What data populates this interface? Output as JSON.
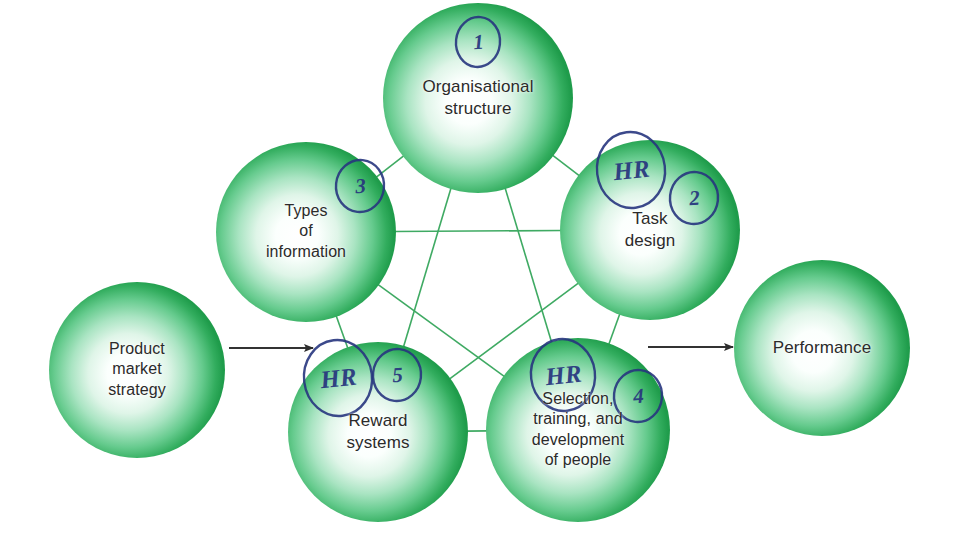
{
  "diagram": {
    "colors": {
      "bubble_edge": "#25a550",
      "bubble_mid": "#7fd3a0",
      "bubble_core": "#ffffff",
      "connector": "#3faa63",
      "arrow": "#333333",
      "label_text": "#2b2b2b",
      "annotation_ink": "#27357e"
    },
    "input_node": {
      "id": "product-market-strategy",
      "label": "Product\nmarket\nstrategy",
      "cx": 137,
      "cy": 370,
      "r": 88
    },
    "output_node": {
      "id": "performance",
      "label": "Performance",
      "cx": 822,
      "cy": 348,
      "r": 88
    },
    "core_nodes": [
      {
        "id": "organisational-structure",
        "label": "Organisational\nstructure",
        "cx": 478,
        "cy": 98,
        "r": 95,
        "annotations": [
          {
            "kind": "number",
            "text": "1",
            "cx": 478,
            "cy": 42,
            "rx": 22,
            "ry": 25
          }
        ]
      },
      {
        "id": "task-design",
        "label": "Task\ndesign",
        "cx": 650,
        "cy": 230,
        "r": 90,
        "annotations": [
          {
            "kind": "letters",
            "text": "HR",
            "cx": 631,
            "cy": 170,
            "rx": 34,
            "ry": 38
          },
          {
            "kind": "number",
            "text": "2",
            "cx": 694,
            "cy": 198,
            "rx": 24,
            "ry": 26
          }
        ]
      },
      {
        "id": "selection-training-development",
        "label": "Selection,\ntraining, and\ndevelopment\nof people",
        "cx": 578,
        "cy": 430,
        "r": 92,
        "annotations": [
          {
            "kind": "letters",
            "text": "HR",
            "cx": 563,
            "cy": 375,
            "rx": 32,
            "ry": 36
          },
          {
            "kind": "number",
            "text": "4",
            "cx": 638,
            "cy": 396,
            "rx": 24,
            "ry": 26
          }
        ]
      },
      {
        "id": "reward-systems",
        "label": "Reward\nsystems",
        "cx": 378,
        "cy": 432,
        "r": 90,
        "annotations": [
          {
            "kind": "letters",
            "text": "HR",
            "cx": 338,
            "cy": 378,
            "rx": 34,
            "ry": 38
          },
          {
            "kind": "number",
            "text": "5",
            "cx": 397,
            "cy": 375,
            "rx": 24,
            "ry": 26
          }
        ]
      },
      {
        "id": "types-of-information",
        "label": "Types\nof\ninformation",
        "cx": 306,
        "cy": 232,
        "r": 90,
        "annotations": [
          {
            "kind": "number",
            "text": "3",
            "cx": 360,
            "cy": 186,
            "rx": 24,
            "ry": 26
          }
        ]
      }
    ],
    "connections": [
      {
        "from": "organisational-structure",
        "to": "task-design"
      },
      {
        "from": "organisational-structure",
        "to": "selection-training-development"
      },
      {
        "from": "organisational-structure",
        "to": "reward-systems"
      },
      {
        "from": "organisational-structure",
        "to": "types-of-information"
      },
      {
        "from": "task-design",
        "to": "selection-training-development"
      },
      {
        "from": "task-design",
        "to": "reward-systems"
      },
      {
        "from": "task-design",
        "to": "types-of-information"
      },
      {
        "from": "selection-training-development",
        "to": "reward-systems"
      },
      {
        "from": "selection-training-development",
        "to": "types-of-information"
      },
      {
        "from": "reward-systems",
        "to": "types-of-information"
      }
    ],
    "arrows": [
      {
        "id": "input-arrow",
        "x1": 229,
        "y1": 348,
        "x2": 313,
        "y2": 348
      },
      {
        "id": "output-arrow",
        "x1": 648,
        "y1": 347,
        "x2": 733,
        "y2": 347
      }
    ]
  }
}
